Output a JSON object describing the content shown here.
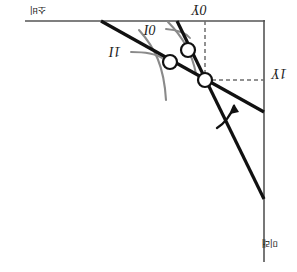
{
  "figure": {
    "title": "",
    "orientation": "rotated-180",
    "background_color": "#ffffff",
    "line_color": "#111111",
    "curve_color": "#8a8a8a",
    "dash_color": "#6e6e6e",
    "axis_color": "#555555",
    "width": 297,
    "height": 272
  },
  "axes": {
    "top_axis": {
      "label": "소비",
      "name": "top-consumption-axis"
    },
    "right_axis": {
      "label": "미래",
      "name": "right-future-axis"
    }
  },
  "labels": {
    "y0": "Y",
    "y0_sub": "0",
    "y1": "Y",
    "y1_sub": "1",
    "i0": "I",
    "i0_sub": "0",
    "i1": "I",
    "i1_sub": "1"
  },
  "points": [
    {
      "name": "equilibrium-point-upper",
      "x": 188,
      "y": 50,
      "r": 7
    },
    {
      "name": "equilibrium-point-middle",
      "x": 170,
      "y": 62,
      "r": 7
    },
    {
      "name": "endowment-point",
      "x": 205,
      "y": 80,
      "r": 7
    }
  ],
  "lines": [
    {
      "name": "steep-budget-line",
      "x1": 177,
      "y1": 21,
      "x2": 264,
      "y2": 199,
      "width": 3.2
    },
    {
      "name": "flat-budget-line",
      "x1": 101,
      "y1": 21,
      "x2": 264,
      "y2": 112,
      "width": 3.2
    }
  ],
  "dashed": [
    {
      "name": "vertical-guide-y0",
      "x1": 205,
      "y1": 21,
      "x2": 205,
      "y2": 80
    },
    {
      "name": "horizontal-guide-y1",
      "x1": 205,
      "y1": 80,
      "x2": 264,
      "y2": 80
    }
  ],
  "indifference_curves": [
    {
      "name": "indifference-curve-i0",
      "path": "M 168 22 C 182 36, 192 52, 196 74"
    },
    {
      "name": "indifference-curve-i1",
      "path": "M 139 30 C 155 48, 164 66, 166 100"
    }
  ],
  "annotations": {
    "rotation_arrow": {
      "name": "rotation-arrow",
      "path": "M 217 128 C 224 124, 231 115, 234 106"
    },
    "leader_i0": {
      "name": "leader-line-i0",
      "path": "M 166 29 C 178 30, 186 33, 190 38"
    },
    "leader_i1": {
      "name": "leader-line-i1",
      "path": "M 131 52 C 146 52, 156 54, 162 58"
    }
  }
}
